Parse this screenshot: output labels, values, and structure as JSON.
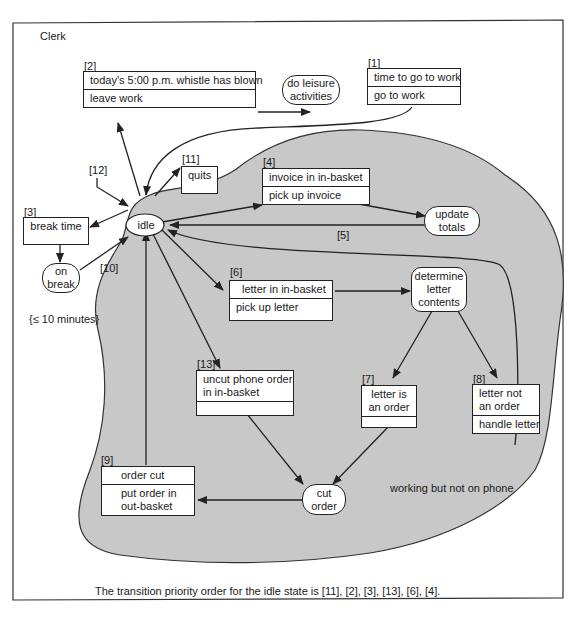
{
  "title": "Clerk",
  "region_label": "working but not on phone",
  "duration_note": "{≤ 10 minutes}",
  "caption": "The transition priority order for the idle state is [11], [2], [3], [13], [6], [4].",
  "colors": {
    "region_fill": "#c8c8c8",
    "line": "#222222",
    "box_fill": "#ffffff"
  },
  "states": {
    "idle": "idle",
    "leisure": "do leisure activities",
    "leisure_l1": "do leisure",
    "leisure_l2": "activities",
    "on_break_l1": "on",
    "on_break_l2": "break",
    "update_l1": "update",
    "update_l2": "totals",
    "determine_l1": "determine",
    "determine_l2": "letter",
    "determine_l3": "contents",
    "cut_l1": "cut",
    "cut_l2": "order"
  },
  "transitions": {
    "t1": {
      "id": "[1]",
      "event": "time to go to work",
      "action": "go to work"
    },
    "t2": {
      "id": "[2]",
      "event": "today's 5:00 p.m. whistle has blown",
      "action": "leave work"
    },
    "t3": {
      "id": "[3]",
      "event": "break time",
      "action": ""
    },
    "t4": {
      "id": "[4]",
      "event": "invoice in in-basket",
      "action": "pick up invoice"
    },
    "t5": {
      "id": "[5]"
    },
    "t6": {
      "id": "[6]",
      "event": "letter in in-basket",
      "action": "pick up letter"
    },
    "t7": {
      "id": "[7]",
      "event_l1": "letter is",
      "event_l2": "an order",
      "action": ""
    },
    "t8": {
      "id": "[8]",
      "event_l1": "letter not",
      "event_l2": "an order",
      "action": "handle letter"
    },
    "t9": {
      "id": "[9]",
      "event": "order cut",
      "action_l1": "put order in",
      "action_l2": "out-basket"
    },
    "t10": {
      "id": "[10]"
    },
    "t11": {
      "id": "[11]",
      "event": "quits",
      "action": ""
    },
    "t12": {
      "id": "[12]"
    },
    "t13": {
      "id": "[13]",
      "event_l1": "uncut phone order",
      "event_l2": "in in-basket",
      "action": ""
    }
  }
}
